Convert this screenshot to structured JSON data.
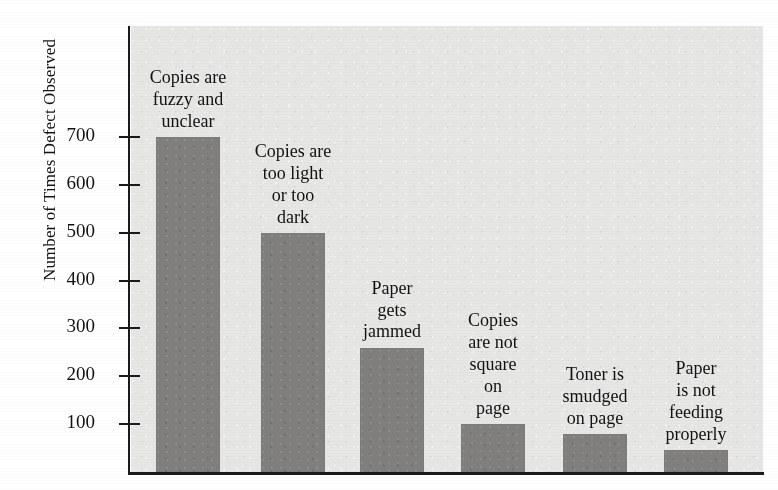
{
  "figure": {
    "background_color": "#ffffff",
    "plot_background_color": "#e6e6e4",
    "bar_color": "#807f7e",
    "axis_color": "#1a1a1a"
  },
  "chart_data": {
    "type": "bar",
    "title": "",
    "subtitle": "",
    "xlabel": "",
    "ylabel": "Number of Times Defect Observed",
    "categories": [
      "Copies are\nfuzzy and\nunclear",
      "Copies are\ntoo light\nor too\ndark",
      "Paper\ngets\njammed",
      "Copies\nare not\nsquare\non\npage",
      "Toner is\nsmudged\non page",
      "Paper\nis not\nfeeding\nproperly"
    ],
    "values": [
      700,
      500,
      260,
      100,
      80,
      45
    ],
    "ylim": [
      0,
      740
    ],
    "yticks": [
      100,
      200,
      300,
      400,
      500,
      600,
      700
    ],
    "ytick_labels": [
      "100",
      "200",
      "300",
      "400",
      "500",
      "600",
      "700"
    ],
    "grid": false,
    "legend": null,
    "orientation": "vertical",
    "sorted": "descending"
  }
}
